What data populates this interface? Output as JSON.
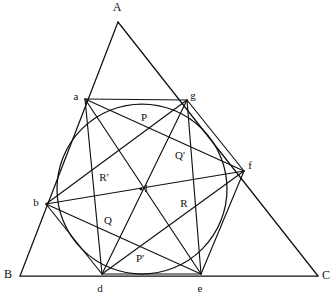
{
  "figure": {
    "background_color": "#ffffff",
    "stroke_color": "#111111",
    "width": 336,
    "height": 301
  },
  "triangle": {
    "name": "ABC",
    "vertices": [
      {
        "id": "A",
        "label": "A",
        "x": 118,
        "y": 22,
        "label_x": 117,
        "label_y": 8
      },
      {
        "id": "B",
        "label": "B",
        "x": 20,
        "y": 276,
        "label_x": 8,
        "label_y": 275
      },
      {
        "id": "C",
        "label": "C",
        "x": 318,
        "y": 276,
        "label_x": 326,
        "label_y": 276
      }
    ],
    "edges": [
      {
        "from": "A",
        "to": "B"
      },
      {
        "from": "B",
        "to": "C"
      },
      {
        "from": "C",
        "to": "A"
      }
    ]
  },
  "circle": {
    "label": "inscribed-circle",
    "center_x": 142,
    "center_y": 189,
    "radius": 85
  },
  "incenter": {
    "id": "I",
    "label": "I",
    "x": 141,
    "y": 189,
    "label_x": 146,
    "label_y": 189,
    "dot_radius": 1.4
  },
  "circle_points": [
    {
      "id": "a",
      "label": "a",
      "x": 85,
      "y": 99,
      "label_x": 76,
      "label_y": 97
    },
    {
      "id": "g",
      "label": "g",
      "x": 187,
      "y": 100,
      "label_x": 193,
      "label_y": 96
    },
    {
      "id": "f",
      "label": "f",
      "x": 244,
      "y": 171,
      "label_x": 250,
      "label_y": 166
    },
    {
      "id": "e",
      "label": "e",
      "x": 201,
      "y": 274,
      "label_x": 200,
      "label_y": 289
    },
    {
      "id": "d",
      "label": "d",
      "x": 102,
      "y": 274,
      "label_x": 100,
      "label_y": 289
    },
    {
      "id": "b",
      "label": "b",
      "x": 46,
      "y": 204,
      "label_x": 36,
      "label_y": 203
    }
  ],
  "chords": [
    {
      "from": "a",
      "to": "g",
      "note": "top-chord"
    },
    {
      "from": "a",
      "to": "d",
      "note": "left-vertical-chord"
    },
    {
      "from": "a",
      "to": "f",
      "note": "a-to-f"
    },
    {
      "from": "a",
      "to": "e",
      "note": "a-to-e"
    },
    {
      "from": "g",
      "to": "b",
      "note": "g-to-b"
    },
    {
      "from": "g",
      "to": "e",
      "note": "right-vertical-chord"
    },
    {
      "from": "g",
      "to": "d",
      "note": "g-to-d"
    },
    {
      "from": "b",
      "to": "f",
      "note": "b-to-f"
    },
    {
      "from": "b",
      "to": "e",
      "note": "b-to-e"
    },
    {
      "from": "b",
      "to": "d",
      "note": "b-to-d"
    },
    {
      "from": "d",
      "to": "e",
      "note": "bottom-chord"
    },
    {
      "from": "d",
      "to": "f",
      "note": "d-to-f"
    },
    {
      "from": "e",
      "to": "f",
      "note": "e-to-f"
    },
    {
      "from": "f",
      "to": "g",
      "note": "f-to-g"
    }
  ],
  "intersection_points": [
    {
      "id": "P",
      "label": "P",
      "x": 145,
      "y": 126,
      "label_x": 144,
      "label_y": 118
    },
    {
      "id": "Qp",
      "label": "Q'",
      "x": 186,
      "y": 151,
      "label_x": 180,
      "label_y": 156
    },
    {
      "id": "Rp",
      "label": "R'",
      "x": 100,
      "y": 173,
      "label_x": 104,
      "label_y": 178
    },
    {
      "id": "Q",
      "label": "Q",
      "x": 102,
      "y": 228,
      "label_x": 108,
      "label_y": 221
    },
    {
      "id": "R",
      "label": "R",
      "x": 192,
      "y": 208,
      "label_x": 184,
      "label_y": 204
    },
    {
      "id": "Pp",
      "label": "P'",
      "x": 142,
      "y": 252,
      "label_x": 140,
      "label_y": 259
    }
  ]
}
